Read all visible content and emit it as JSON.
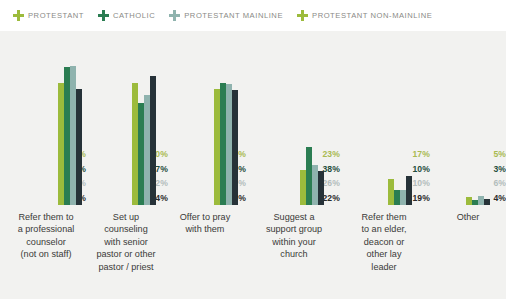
{
  "legend": {
    "items": [
      {
        "label": "PROTESTANT",
        "icon": "cross-icon",
        "color": "#9cbb3c"
      },
      {
        "label": "CATHOLIC",
        "icon": "cross-icon",
        "color": "#2b7d52"
      },
      {
        "label": "PROTESTANT MAINLINE",
        "icon": "cross-icon",
        "color": "#8fb3ae"
      },
      {
        "label": "PROTESTANT NON-MAINLINE",
        "icon": "cross-icon",
        "color": "#9cbb3c"
      }
    ]
  },
  "colors": {
    "protestant": "#9cbb3c",
    "catholic": "#2b7d52",
    "protestant_mainline": "#8fb3ae",
    "protestant_non_mainline": "#263238",
    "background": "#f2f2f0",
    "legend_background": "#ffffff",
    "label_protestant": "#a9ba52",
    "label_catholic": "#1f4d3d",
    "label_mainline": "#b3bdbc",
    "label_non_mainline": "#2b2b2b",
    "category_text": "#3a3a38"
  },
  "chart_data": {
    "type": "bar",
    "title": "",
    "subtitle": "",
    "xlabel": "",
    "ylabel": "",
    "ylim": [
      0,
      100
    ],
    "grid": false,
    "legend_position": "top-left",
    "categories": [
      "Refer them to a professional counselor (not on staff)",
      "Set up counseling with senior pastor or other pastor / priest",
      "Offer to pray with them",
      "Suggest a support group within your church",
      "Refer them to an elder, deacon or other lay leader",
      "Other"
    ],
    "series": [
      {
        "name": "PROTESTANT",
        "color": "#9cbb3c",
        "values": [
          80,
          80,
          76,
          23,
          17,
          5
        ],
        "labels": [
          "80%",
          "80%",
          "76%",
          "23%",
          "17%",
          "5%"
        ]
      },
      {
        "name": "CATHOLIC",
        "color": "#2b7d52",
        "values": [
          90,
          67,
          80,
          38,
          10,
          3
        ],
        "labels": [
          "90%",
          "67%",
          "80%",
          "38%",
          "10%",
          "3%"
        ]
      },
      {
        "name": "PROTESTANT MAINLINE",
        "color": "#8fb3ae",
        "values": [
          91,
          72,
          79,
          26,
          10,
          6
        ],
        "labels": [
          "91%",
          "72%",
          "79%",
          "26%",
          "10%",
          "6%"
        ]
      },
      {
        "name": "PROTESTANT NON-MAINLINE",
        "color": "#263238",
        "values": [
          76,
          84,
          75,
          22,
          19,
          4
        ],
        "labels": [
          "76%",
          "84%",
          "75%",
          "22%",
          "19%",
          "4%"
        ]
      }
    ]
  },
  "groups": [
    {
      "name": "refer-professional-counselor",
      "category_lines": [
        "Refer them to",
        "a professional",
        "counselor",
        "(not on staff)"
      ],
      "labels": [
        "80%",
        "90%",
        "91%",
        "76%"
      ]
    },
    {
      "name": "set-up-counseling-pastor",
      "category_lines": [
        "Set up",
        "counseling",
        "with senior",
        "pastor or other",
        "pastor / priest"
      ],
      "labels": [
        "80%",
        "67%",
        "72%",
        "84%"
      ]
    },
    {
      "name": "offer-to-pray",
      "category_lines": [
        "Offer to pray",
        "with them"
      ],
      "labels": [
        "76%",
        "80%",
        "79%",
        "75%"
      ]
    },
    {
      "name": "suggest-support-group",
      "category_lines": [
        "Suggest a",
        "support group",
        "within your",
        "church"
      ],
      "labels": [
        "23%",
        "38%",
        "26%",
        "22%"
      ]
    },
    {
      "name": "refer-elder-deacon",
      "category_lines": [
        "Refer them",
        "to an elder,",
        "deacon or",
        "other lay",
        "leader"
      ],
      "labels": [
        "17%",
        "10%",
        "10%",
        "19%"
      ]
    },
    {
      "name": "other",
      "category_lines": [
        "Other"
      ],
      "labels": [
        "5%",
        "3%",
        "6%",
        "4%"
      ]
    }
  ]
}
